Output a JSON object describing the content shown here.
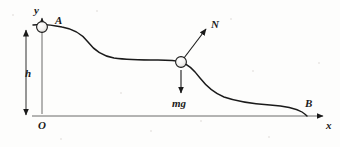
{
  "figure": {
    "type": "physics-free-body-diagram",
    "width": 340,
    "height": 147,
    "background_color": "#fdfdfc",
    "stroke_color": "#1a1a1a",
    "axes": {
      "origin_label": "O",
      "x_axis_label": "x",
      "y_axis_label": "y",
      "x_axis": {
        "x_start": 32,
        "x_end": 325,
        "y": 116
      },
      "y_axis": {
        "x": 42,
        "y_start": 108,
        "y_end": 16
      }
    },
    "points": [
      {
        "name": "A",
        "label": "A",
        "x": 42,
        "y": 27,
        "has_ball": true
      },
      {
        "name": "P",
        "label": "",
        "x": 181,
        "y": 62,
        "has_ball": true
      },
      {
        "name": "B",
        "label": "B",
        "x": 307,
        "y": 116,
        "has_ball": false
      }
    ],
    "dimension": {
      "label": "h",
      "kind": "double-headed-vertical-arrow",
      "x": 26,
      "y_top": 30,
      "y_bottom": 116,
      "label_x": 25,
      "label_y": 68
    },
    "forces": [
      {
        "name": "normal-force",
        "label": "N",
        "from_x": 184,
        "from_y": 58,
        "to_x": 206,
        "to_y": 29,
        "label_x": 211,
        "label_y": 19
      },
      {
        "name": "weight",
        "label": "mg",
        "from_x": 181,
        "from_y": 70,
        "to_x": 181,
        "to_y": 93,
        "label_x": 172,
        "label_y": 98
      }
    ],
    "curve": {
      "name": "hill-profile",
      "path": "M 33 25 C 40 24, 52 25, 62 27 C 74 29, 82 34, 88 42 C 94 50, 102 56, 114 58 C 128 60, 145 60, 158 60 C 168 60, 175 60, 181 62 C 188 64, 194 70, 200 78 C 207 87, 214 93, 224 97 C 238 102, 256 104, 270 105 C 284 106, 295 108, 302 112 C 305 114, 306 115, 307 116"
    }
  }
}
